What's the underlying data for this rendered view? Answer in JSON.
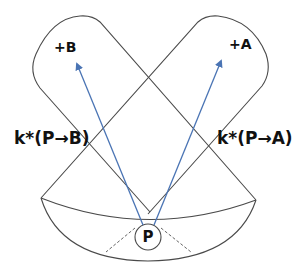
{
  "labels": {
    "point_b": "+B",
    "point_a": "+A",
    "k_p_to_b": "k*(P→B)",
    "k_p_to_a": "k*(P→A)",
    "p": "P"
  },
  "colors": {
    "outline": "#4a4a4a",
    "arrow": "#4a74b4",
    "text": "#111111"
  },
  "shapes": {
    "region_b": "rounded lobe containing +B",
    "region_a": "rounded lobe containing +A",
    "lower_sector": "curved band below intersection containing P",
    "arrow_p_to_b": "blue arrow from P to B",
    "arrow_p_to_a": "blue arrow from P to A",
    "dashed_lines": 2
  }
}
